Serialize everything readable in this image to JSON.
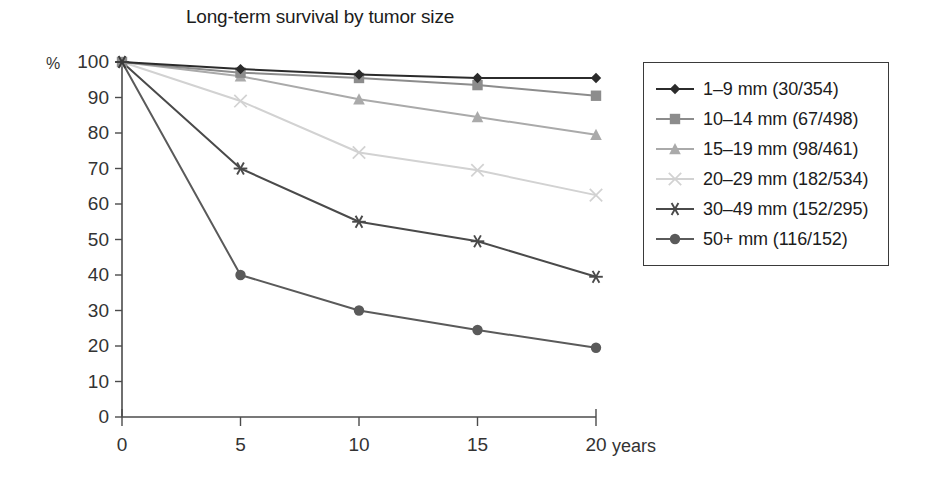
{
  "chart_data": {
    "type": "line",
    "title": "Long-term survival by tumor size",
    "xlabel": "years",
    "ylabel": "%",
    "x": [
      0,
      5,
      10,
      15,
      20
    ],
    "xtick_labels": [
      "0",
      "5",
      "10",
      "15",
      "20"
    ],
    "ytick_labels": [
      "0",
      "10",
      "20",
      "30",
      "40",
      "50",
      "60",
      "70",
      "80",
      "90",
      "100"
    ],
    "ylim": [
      0,
      100
    ],
    "xlim": [
      0,
      20
    ],
    "grid": false,
    "legend_position": "right",
    "series": [
      {
        "name": "1–9 mm (30/354)",
        "marker": "diamond",
        "color": "#2b2b2b",
        "values": [
          100,
          98,
          96.5,
          95.5,
          95.5
        ]
      },
      {
        "name": "10–14 mm (67/498)",
        "marker": "square",
        "color": "#8c8c8c",
        "values": [
          100,
          97,
          95.5,
          93.5,
          90.5
        ]
      },
      {
        "name": "15–19 mm (98/461)",
        "marker": "triangle",
        "color": "#aaaaaa",
        "values": [
          100,
          96,
          89.5,
          84.5,
          79.5
        ]
      },
      {
        "name": "20–29 mm (182/534)",
        "marker": "cross",
        "color": "#d2d2d2",
        "values": [
          100,
          89,
          74.5,
          69.5,
          62.5
        ]
      },
      {
        "name": "30–49 mm (152/295)",
        "marker": "asterisk",
        "color": "#4a4a4a",
        "values": [
          100,
          70,
          55,
          49.5,
          39.5
        ]
      },
      {
        "name": "50+ mm (116/152)",
        "marker": "circle",
        "color": "#5a5a5a",
        "values": [
          100,
          40,
          30,
          24.5,
          19.5
        ]
      }
    ]
  },
  "axis": {
    "percent_sign": "%",
    "years_caption": "years"
  }
}
